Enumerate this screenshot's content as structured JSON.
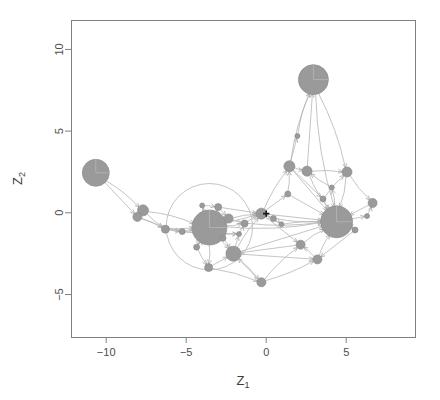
{
  "figure": {
    "background_color": "#ffffff",
    "box_color": "#808080",
    "node_color": "#9a9a9a",
    "node_border_color": "#8d8d8d",
    "edge_color": "#b0b0b0",
    "ring_color": "#bdbdbd",
    "center_marker_color": "#1a1a1a",
    "plot_box": {
      "left": 71,
      "top": 20,
      "right": 415,
      "bottom": 337
    }
  },
  "axes": {
    "x": {
      "label": "Z",
      "label_sub": "1",
      "ticks": [
        -10,
        -5,
        0,
        5
      ],
      "tick_labels": [
        "−10",
        "−5",
        "0",
        "5"
      ],
      "range": [
        -12.2,
        9.3
      ],
      "pixel_range": [
        71,
        415
      ]
    },
    "y": {
      "label": "Z",
      "label_sub": "2",
      "ticks": [
        -5,
        0,
        5,
        10
      ],
      "tick_labels": [
        "−5",
        "0",
        "5",
        "10"
      ],
      "range": [
        -7.6,
        11.8
      ],
      "pixel_range": [
        337,
        20
      ]
    }
  },
  "chart_data": {
    "type": "scatter",
    "title": "",
    "xlabel": "Z1",
    "ylabel": "Z2",
    "xlim": [
      -12.2,
      9.3
    ],
    "ylim": [
      -7.6,
      11.8
    ],
    "grid": false,
    "legend": null,
    "annotations": [
      {
        "name": "origin-cross",
        "x": 0.0,
        "y": -0.05,
        "glyph": "+"
      },
      {
        "name": "cluster-ring",
        "cx": -3.55,
        "cy": -0.85,
        "radius_data": 2.7
      }
    ],
    "nodes": [
      {
        "id": 0,
        "x": -10.65,
        "y": 2.45,
        "size": 13.5,
        "wedge": true
      },
      {
        "id": 1,
        "x": 2.95,
        "y": 8.15,
        "size": 15.0,
        "wedge": true
      },
      {
        "id": 2,
        "x": -3.55,
        "y": -0.9,
        "size": 17.5,
        "wedge": true
      },
      {
        "id": 3,
        "x": 4.4,
        "y": -0.55,
        "size": 16.0,
        "wedge": true
      },
      {
        "id": 4,
        "x": -7.7,
        "y": 0.15,
        "size": 5.5
      },
      {
        "id": 5,
        "x": -8.05,
        "y": -0.25,
        "size": 4.5
      },
      {
        "id": 6,
        "x": -6.3,
        "y": -1.0,
        "size": 4.0
      },
      {
        "id": 7,
        "x": -2.05,
        "y": -2.5,
        "size": 7.5
      },
      {
        "id": 8,
        "x": -2.35,
        "y": -0.35,
        "size": 4.5
      },
      {
        "id": 9,
        "x": -3.0,
        "y": 0.35,
        "size": 3.5
      },
      {
        "id": 10,
        "x": -3.6,
        "y": -3.35,
        "size": 4.0
      },
      {
        "id": 11,
        "x": -1.35,
        "y": -0.65,
        "size": 3.5
      },
      {
        "id": 12,
        "x": -0.3,
        "y": -0.05,
        "size": 5.5
      },
      {
        "id": 13,
        "x": 1.45,
        "y": 2.85,
        "size": 5.5
      },
      {
        "id": 14,
        "x": 2.55,
        "y": 2.55,
        "size": 5.0
      },
      {
        "id": 15,
        "x": 5.05,
        "y": 2.5,
        "size": 5.0
      },
      {
        "id": 16,
        "x": 6.65,
        "y": 0.6,
        "size": 4.5
      },
      {
        "id": 17,
        "x": 2.15,
        "y": -1.95,
        "size": 4.5
      },
      {
        "id": 18,
        "x": 3.2,
        "y": -2.85,
        "size": 4.5
      },
      {
        "id": 19,
        "x": -0.3,
        "y": -4.25,
        "size": 4.5
      },
      {
        "id": 20,
        "x": 0.45,
        "y": -0.35,
        "size": 3.0
      },
      {
        "id": 21,
        "x": 1.35,
        "y": 1.15,
        "size": 3.0
      },
      {
        "id": 22,
        "x": 3.55,
        "y": 0.85,
        "size": 3.0
      },
      {
        "id": 23,
        "x": 5.55,
        "y": -1.05,
        "size": 3.0
      },
      {
        "id": 24,
        "x": -5.25,
        "y": -1.15,
        "size": 3.0
      },
      {
        "id": 25,
        "x": -2.7,
        "y": -1.55,
        "size": 3.0
      },
      {
        "id": 26,
        "x": -4.35,
        "y": -2.1,
        "size": 3.0
      },
      {
        "id": 27,
        "x": 0.95,
        "y": -0.7,
        "size": 2.5
      },
      {
        "id": 28,
        "x": 4.1,
        "y": 1.55,
        "size": 2.5
      },
      {
        "id": 29,
        "x": 1.95,
        "y": 4.7,
        "size": 2.5
      },
      {
        "id": 30,
        "x": -4.0,
        "y": 0.45,
        "size": 2.5
      },
      {
        "id": 31,
        "x": -1.7,
        "y": -1.3,
        "size": 2.5
      },
      {
        "id": 32,
        "x": 6.3,
        "y": -0.2,
        "size": 2.5
      }
    ],
    "edges": [
      [
        0,
        4
      ],
      [
        0,
        5
      ],
      [
        4,
        6
      ],
      [
        5,
        6
      ],
      [
        4,
        5
      ],
      [
        6,
        24
      ],
      [
        24,
        2
      ],
      [
        6,
        2
      ],
      [
        5,
        24
      ],
      [
        4,
        2
      ],
      [
        2,
        30
      ],
      [
        2,
        9
      ],
      [
        2,
        8
      ],
      [
        2,
        25
      ],
      [
        2,
        26
      ],
      [
        2,
        10
      ],
      [
        2,
        7
      ],
      [
        26,
        10
      ],
      [
        25,
        7
      ],
      [
        9,
        8
      ],
      [
        8,
        11
      ],
      [
        11,
        12
      ],
      [
        7,
        31
      ],
      [
        31,
        11
      ],
      [
        7,
        19
      ],
      [
        10,
        7
      ],
      [
        12,
        20
      ],
      [
        20,
        27
      ],
      [
        12,
        21
      ],
      [
        21,
        13
      ],
      [
        13,
        1
      ],
      [
        14,
        1
      ],
      [
        13,
        14
      ],
      [
        14,
        15
      ],
      [
        13,
        22
      ],
      [
        22,
        3
      ],
      [
        15,
        3
      ],
      [
        16,
        3
      ],
      [
        15,
        16
      ],
      [
        3,
        23
      ],
      [
        23,
        18
      ],
      [
        18,
        17
      ],
      [
        17,
        3
      ],
      [
        17,
        7
      ],
      [
        19,
        18
      ],
      [
        19,
        17
      ],
      [
        12,
        3
      ],
      [
        11,
        3
      ],
      [
        8,
        12
      ],
      [
        2,
        12
      ],
      [
        2,
        11
      ],
      [
        7,
        12
      ],
      [
        7,
        3
      ],
      [
        3,
        28
      ],
      [
        28,
        14
      ],
      [
        3,
        32
      ],
      [
        32,
        16
      ],
      [
        29,
        1
      ],
      [
        13,
        29
      ],
      [
        2,
        3
      ],
      [
        12,
        13
      ],
      [
        12,
        17
      ],
      [
        20,
        3
      ],
      [
        27,
        3
      ],
      [
        9,
        12
      ],
      [
        1,
        3
      ],
      [
        1,
        15
      ],
      [
        13,
        3
      ],
      [
        14,
        3
      ],
      [
        10,
        19
      ],
      [
        7,
        18
      ],
      [
        26,
        2
      ],
      [
        30,
        9
      ],
      [
        24,
        31
      ],
      [
        6,
        31
      ],
      [
        22,
        15
      ],
      [
        21,
        3
      ],
      [
        23,
        3
      ],
      [
        18,
        3
      ],
      [
        19,
        7
      ]
    ]
  }
}
